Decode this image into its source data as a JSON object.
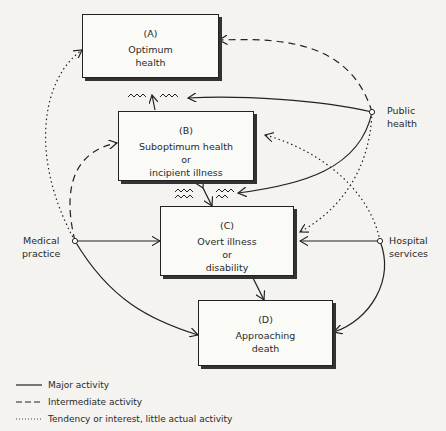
{
  "diagram": {
    "nodes": [
      {
        "id": "A",
        "code": "(A)",
        "lines": [
          "Optimum",
          "health"
        ]
      },
      {
        "id": "B",
        "code": "(B)",
        "lines": [
          "Suboptimum health",
          "or",
          "incipient illness"
        ]
      },
      {
        "id": "C",
        "code": "(C)",
        "lines": [
          "Overt illness",
          "or",
          "disability"
        ]
      },
      {
        "id": "D",
        "code": "(D)",
        "lines": [
          "Approaching",
          "death"
        ]
      }
    ],
    "actors": {
      "public_health": [
        "Public",
        "health"
      ],
      "medical_practice": [
        "Medical",
        "practice"
      ],
      "hospital_services": [
        "Hospital",
        "services"
      ]
    },
    "edges": [
      {
        "from": "Public health",
        "to": "A",
        "type": "intermediate"
      },
      {
        "from": "Public health",
        "to": "A-B transition",
        "type": "major"
      },
      {
        "from": "Public health",
        "to": "B-C transition",
        "type": "major"
      },
      {
        "from": "Public health",
        "to": "C",
        "type": "tendency"
      },
      {
        "from": "Medical practice",
        "to": "A",
        "type": "tendency"
      },
      {
        "from": "Medical practice",
        "to": "B",
        "type": "intermediate"
      },
      {
        "from": "Medical practice",
        "to": "C",
        "type": "major"
      },
      {
        "from": "Medical practice",
        "to": "D",
        "type": "major"
      },
      {
        "from": "Hospital services",
        "to": "B",
        "type": "tendency"
      },
      {
        "from": "Hospital services",
        "to": "C",
        "type": "major"
      },
      {
        "from": "Hospital services",
        "to": "D",
        "type": "major"
      },
      {
        "from": "C",
        "to": "D",
        "type": "bidirectional"
      }
    ]
  },
  "legend": [
    {
      "style": "solid",
      "label": "Major activity"
    },
    {
      "style": "dashed",
      "label": "Intermediate activity"
    },
    {
      "style": "dotted",
      "label": "Tendency or interest, little actual activity"
    }
  ]
}
